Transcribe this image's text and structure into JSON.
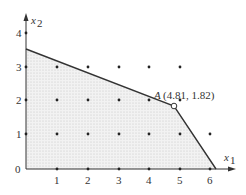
{
  "figure": {
    "axes": {
      "x_label": "x",
      "x_label_sub": "1",
      "y_label": "x",
      "y_label_sub": "2",
      "origin_label": "0",
      "x_ticks": [
        "1",
        "2",
        "3",
        "4",
        "5",
        "6"
      ],
      "y_ticks": [
        "1",
        "2",
        "3",
        "4"
      ]
    },
    "point": {
      "name": "A",
      "coords_label": "(4.81, 1.82)",
      "x": 4.81,
      "y": 1.82
    },
    "feasible_region": {
      "vertices": [
        [
          0,
          0
        ],
        [
          0,
          3.5
        ],
        [
          4.81,
          1.82
        ],
        [
          6.2,
          0
        ]
      ],
      "fill": "dotted-gray"
    },
    "lattice_points": [
      [
        1,
        0
      ],
      [
        2,
        0
      ],
      [
        3,
        0
      ],
      [
        4,
        0
      ],
      [
        5,
        0
      ],
      [
        6,
        0
      ],
      [
        1,
        1
      ],
      [
        2,
        1
      ],
      [
        3,
        1
      ],
      [
        4,
        1
      ],
      [
        5,
        1
      ],
      [
        6,
        1
      ],
      [
        1,
        2
      ],
      [
        2,
        2
      ],
      [
        3,
        2
      ],
      [
        4,
        2
      ],
      [
        5,
        2
      ],
      [
        1,
        3
      ],
      [
        2,
        3
      ],
      [
        3,
        3
      ],
      [
        4,
        3
      ],
      [
        5,
        3
      ],
      [
        0,
        1
      ],
      [
        0,
        2
      ],
      [
        0,
        3
      ],
      [
        0,
        4
      ]
    ]
  }
}
